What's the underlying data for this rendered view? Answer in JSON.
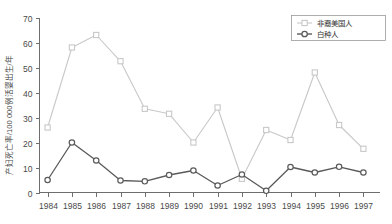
{
  "chart_data": {
    "type": "line",
    "title": "",
    "xlabel": "",
    "ylabel": "产妇死亡率/100 000例活婴出生/年",
    "categories": [
      "1984",
      "1985",
      "1986",
      "1987",
      "1988",
      "1989",
      "1990",
      "1991",
      "1992",
      "1993",
      "1994",
      "1995",
      "1996",
      "1997"
    ],
    "x": [
      1984,
      1985,
      1986,
      1987,
      1988,
      1989,
      1990,
      1991,
      1992,
      1993,
      1994,
      1995,
      1996,
      1997
    ],
    "ylim": [
      0,
      70
    ],
    "yticks": [
      0,
      10,
      20,
      30,
      40,
      50,
      60,
      70
    ],
    "ytick_labels": [
      "0",
      "10",
      "20",
      "30",
      "40",
      "50",
      "60",
      "70"
    ],
    "grid": false,
    "legend_position": "top-right",
    "series": [
      {
        "name": "非裔美国人",
        "color": "#c8c8c8",
        "marker": "square",
        "values": [
          26,
          58,
          63,
          52.5,
          33.5,
          31.5,
          20,
          34,
          5.5,
          25,
          21,
          48,
          27,
          17.5
        ]
      },
      {
        "name": "白种人",
        "color": "#5a5a5a",
        "marker": "circle",
        "values": [
          5,
          20,
          12.8,
          4.8,
          4.5,
          7,
          8.8,
          2.8,
          7.2,
          0.7,
          10.2,
          8,
          10.3,
          8
        ]
      }
    ]
  },
  "legend": {
    "entries": [
      {
        "label": "非裔美国人"
      },
      {
        "label": "白种人"
      }
    ]
  },
  "axes": {
    "y_title": "产妇死亡率/100 000例活婴出生/年"
  }
}
